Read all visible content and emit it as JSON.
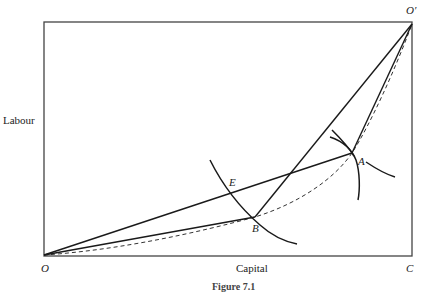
{
  "diagram": {
    "type": "Edgeworth box",
    "axes": {
      "y_label": "Labour",
      "x_label": "Capital"
    },
    "points": {
      "origin": "O",
      "origin_prime": "O′",
      "corner": "C",
      "a": "A",
      "b": "B",
      "e": "E"
    },
    "caption": "Figure 7.1",
    "colors": {
      "line": "#1a1a1a",
      "box": "#444444",
      "background": "#ffffff"
    }
  }
}
